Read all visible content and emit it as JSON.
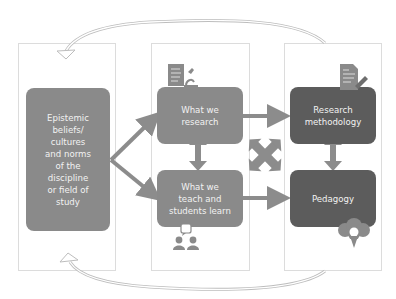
{
  "diagram": {
    "columns": [
      {
        "id": "context",
        "label": ""
      },
      {
        "id": "content",
        "label": ""
      },
      {
        "id": "practice",
        "label": ""
      }
    ],
    "nodes": {
      "epistemic": {
        "label": "Epistemic\nbeliefs/\ncultures\nand norms\nof the\ndiscipline\nor field of\nstudy"
      },
      "research": {
        "label": "What we\nresearch"
      },
      "teach": {
        "label": "What we\nteach and\nstudents learn"
      },
      "methodology": {
        "label": "Research\nmethodology"
      },
      "pedagogy": {
        "label": "Pedagogy"
      }
    },
    "edges": [
      {
        "from": "epistemic",
        "to": "research",
        "type": "arrow"
      },
      {
        "from": "epistemic",
        "to": "teach",
        "type": "arrow"
      },
      {
        "from": "research",
        "to": "teach",
        "type": "bidirectional"
      },
      {
        "from": "research",
        "to": "methodology",
        "type": "arrow"
      },
      {
        "from": "teach",
        "to": "pedagogy",
        "type": "arrow"
      },
      {
        "from": "methodology",
        "to": "pedagogy",
        "type": "bidirectional"
      },
      {
        "from": "cross",
        "to": "cross",
        "type": "four-way-cross"
      },
      {
        "from": "practice",
        "to": "context",
        "type": "curved-feedback-top"
      },
      {
        "from": "practice",
        "to": "context",
        "type": "curved-feedback-bottom"
      }
    ],
    "icons": [
      "document-microscope-icon",
      "students-speech-icon",
      "document-pen-icon",
      "tree-lightbulb-icon"
    ],
    "colors": {
      "node_light": "#8a8a8a",
      "node_dark": "#5c5c5c",
      "arrow": "#8c8c8c",
      "panel_border": "#dcdcdc"
    }
  }
}
